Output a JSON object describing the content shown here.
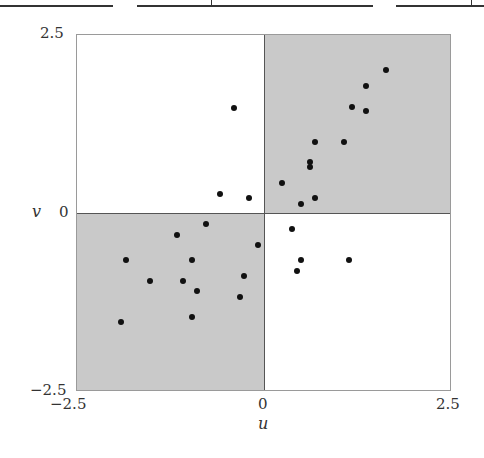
{
  "chart_data": {
    "type": "scatter",
    "title": "",
    "xlabel": "u",
    "ylabel": "v",
    "xlim": [
      -2.5,
      2.5
    ],
    "ylim": [
      -2.5,
      2.5
    ],
    "x_ticks": [
      "−2.5",
      "0",
      "2.5"
    ],
    "y_ticks": [
      "2.5",
      "0",
      "−2.5"
    ],
    "grid": false,
    "shaded_quadrants": [
      "u>0,v>0",
      "u<0,v<0"
    ],
    "shade_color": "#c9c9c9",
    "point_color": "#111111",
    "points": [
      {
        "u": 1.63,
        "v": 2.0
      },
      {
        "u": 1.37,
        "v": 1.77
      },
      {
        "u": 1.18,
        "v": 1.48
      },
      {
        "u": 1.37,
        "v": 1.42
      },
      {
        "u": 0.69,
        "v": 0.99
      },
      {
        "u": 1.07,
        "v": 0.99
      },
      {
        "u": 0.62,
        "v": 0.71
      },
      {
        "u": 0.62,
        "v": 0.64
      },
      {
        "u": 0.25,
        "v": 0.41
      },
      {
        "u": 0.69,
        "v": 0.2
      },
      {
        "u": 0.5,
        "v": 0.12
      },
      {
        "u": -0.4,
        "v": 1.47
      },
      {
        "u": -0.58,
        "v": 0.26
      },
      {
        "u": -0.19,
        "v": 0.2
      },
      {
        "u": -0.77,
        "v": -0.16
      },
      {
        "u": -1.15,
        "v": -0.31
      },
      {
        "u": -0.07,
        "v": -0.45
      },
      {
        "u": -1.84,
        "v": -0.67
      },
      {
        "u": -0.96,
        "v": -0.67
      },
      {
        "u": -0.26,
        "v": -0.89
      },
      {
        "u": -1.52,
        "v": -0.96
      },
      {
        "u": -1.08,
        "v": -0.96
      },
      {
        "u": -0.89,
        "v": -1.1
      },
      {
        "u": -0.31,
        "v": -1.18
      },
      {
        "u": -0.96,
        "v": -1.46
      },
      {
        "u": -1.9,
        "v": -1.54
      },
      {
        "u": 0.38,
        "v": -0.23
      },
      {
        "u": 0.5,
        "v": -0.66
      },
      {
        "u": 1.14,
        "v": -0.66
      },
      {
        "u": 0.44,
        "v": -0.82
      }
    ]
  },
  "labels": {
    "x_axis": "u",
    "y_axis": "v",
    "x_tick_min": "−2.5",
    "x_tick_zero": "0",
    "x_tick_max": "2.5",
    "y_tick_max": "2.5",
    "y_tick_zero": "0",
    "y_tick_min": "−2.5"
  }
}
